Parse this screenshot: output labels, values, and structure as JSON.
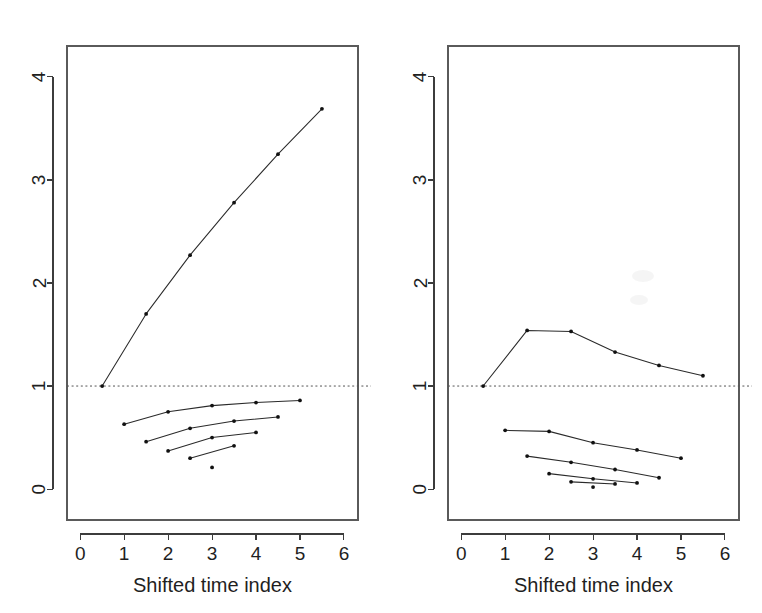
{
  "figure": {
    "background": "#ffffff",
    "line_color": "#2a2a2a",
    "point_color": "#111111",
    "reference_line_color": "#555555",
    "panel_count": 2
  },
  "chart_data": [
    {
      "type": "line",
      "panel": "left",
      "title": "",
      "xlabel": "Shifted time index",
      "ylabel": "",
      "xlim": [
        -0.3,
        6.32
      ],
      "ylim": [
        -0.3,
        4.3
      ],
      "xticks": [
        0,
        1,
        2,
        3,
        4,
        5,
        6
      ],
      "xticklabels": [
        "0",
        "1",
        "2",
        "3",
        "4",
        "5",
        "6"
      ],
      "yticks": [
        0,
        1,
        2,
        3,
        4
      ],
      "yticklabels": [
        "0",
        "1",
        "2",
        "3",
        "4"
      ],
      "grid": false,
      "legend": "none",
      "reference_lines": [
        {
          "orientation": "horizontal",
          "y": 1.0,
          "style": "dotted"
        }
      ],
      "series": [
        {
          "name": "upper-increasing",
          "x": [
            0.5,
            1.5,
            2.5,
            3.5,
            4.5,
            5.5
          ],
          "values": [
            1.0,
            1.7,
            2.27,
            2.78,
            3.25,
            3.69
          ]
        },
        {
          "name": "lower-curve-1",
          "x": [
            1.0,
            2.0,
            3.0,
            4.0,
            5.0
          ],
          "values": [
            0.63,
            0.75,
            0.81,
            0.84,
            0.86
          ]
        },
        {
          "name": "lower-curve-2",
          "x": [
            1.5,
            2.5,
            3.5,
            4.5
          ],
          "values": [
            0.46,
            0.59,
            0.66,
            0.7
          ]
        },
        {
          "name": "lower-curve-3",
          "x": [
            2.0,
            3.0,
            4.0
          ],
          "values": [
            0.37,
            0.5,
            0.55
          ]
        },
        {
          "name": "lower-curve-4",
          "x": [
            2.5,
            3.5
          ],
          "values": [
            0.3,
            0.42
          ]
        },
        {
          "name": "isolated-point",
          "x": [
            3.0
          ],
          "values": [
            0.21
          ]
        }
      ]
    },
    {
      "type": "line",
      "panel": "right",
      "title": "",
      "xlabel": "Shifted time index",
      "ylabel": "",
      "xlim": [
        -0.3,
        6.32
      ],
      "ylim": [
        -0.3,
        4.3
      ],
      "xticks": [
        0,
        1,
        2,
        3,
        4,
        5,
        6
      ],
      "xticklabels": [
        "0",
        "1",
        "2",
        "3",
        "4",
        "5",
        "6"
      ],
      "yticks": [
        0,
        1,
        2,
        3,
        4
      ],
      "yticklabels": [
        "0",
        "1",
        "2",
        "3",
        "4"
      ],
      "grid": false,
      "legend": "none",
      "reference_lines": [
        {
          "orientation": "horizontal",
          "y": 1.0,
          "style": "dotted"
        }
      ],
      "series": [
        {
          "name": "upper-peaked",
          "x": [
            0.5,
            1.5,
            2.5,
            3.5,
            4.5,
            5.5
          ],
          "values": [
            1.0,
            1.54,
            1.53,
            1.33,
            1.2,
            1.1
          ]
        },
        {
          "name": "lower-curve-1",
          "x": [
            1.0,
            2.0,
            3.0,
            4.0,
            5.0
          ],
          "values": [
            0.57,
            0.56,
            0.45,
            0.38,
            0.3
          ]
        },
        {
          "name": "lower-curve-2",
          "x": [
            1.5,
            2.5,
            3.5,
            4.5
          ],
          "values": [
            0.32,
            0.26,
            0.19,
            0.11
          ]
        },
        {
          "name": "lower-curve-3",
          "x": [
            2.0,
            3.0,
            4.0
          ],
          "values": [
            0.15,
            0.1,
            0.06
          ]
        },
        {
          "name": "lower-curve-4",
          "x": [
            2.5,
            3.5
          ],
          "values": [
            0.07,
            0.05
          ]
        },
        {
          "name": "isolated-point",
          "x": [
            3.0
          ],
          "values": [
            0.02
          ]
        }
      ]
    }
  ]
}
